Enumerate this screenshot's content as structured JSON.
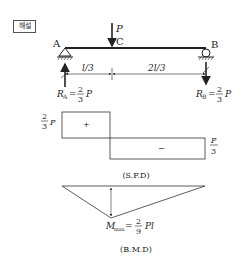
{
  "badge": "해설",
  "beam": {
    "support_a": "A",
    "support_b": "B",
    "point_c": "C",
    "load": "P",
    "span_left": "l/3",
    "span_right": "2l/3",
    "reaction_a": {
      "symbol": "R",
      "sub": "A",
      "num": "2",
      "den": "3",
      "unit": "P"
    },
    "reaction_b": {
      "symbol": "R",
      "sub": "B",
      "num": "2",
      "den": "3",
      "unit": "P"
    }
  },
  "sfd": {
    "left_value": {
      "num": "2",
      "den": "3",
      "unit": "P"
    },
    "right_value": {
      "num": "P",
      "den": "3"
    },
    "positive_sign": "+",
    "negative_sign": "−",
    "caption": "(S.F.D)"
  },
  "bmd": {
    "max_label": {
      "symbol": "M",
      "sub": "max",
      "num": "2",
      "den": "9",
      "unit": "Pl"
    },
    "caption": "(B.M.D)"
  }
}
